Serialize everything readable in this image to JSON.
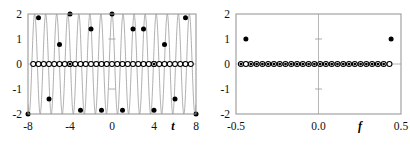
{
  "figure": {
    "title": "",
    "panels": [
      {
        "id": "time-domain",
        "xlabel": "t",
        "ylabel": "",
        "xlim": [
          -8,
          8
        ],
        "ylim": [
          -2,
          2
        ],
        "xticks": [
          -8,
          -4,
          0,
          4,
          8
        ],
        "xticklabels": [
          "-8",
          "-4",
          "0",
          "4",
          "8"
        ],
        "yticks": [
          -2,
          -1,
          0,
          1,
          2
        ],
        "yticklabels": [
          "-2",
          "-1",
          "0",
          "1",
          "2"
        ],
        "grid": false,
        "frame": true
      },
      {
        "id": "frequency-domain",
        "xlabel": "f",
        "ylabel": "",
        "xlim": [
          -0.5,
          0.5
        ],
        "ylim": [
          -2,
          2
        ],
        "xticks": [
          -0.5,
          0.0,
          0.5
        ],
        "xticklabels": [
          "-0.5",
          "0.0",
          "0.5"
        ],
        "yticks": [
          -2,
          -1,
          0,
          1,
          2
        ],
        "yticklabels": [
          "-2",
          "-1",
          "0",
          "1",
          "2"
        ],
        "grid": false,
        "frame": true
      }
    ]
  },
  "chart_data": [
    {
      "type": "line",
      "id": "time-domain",
      "title": "",
      "xlabel": "t",
      "ylabel": "",
      "xlim": [
        -8,
        8
      ],
      "ylim": [
        -2,
        2
      ],
      "xticks": [
        -8,
        -4,
        0,
        4,
        8
      ],
      "yticks": [
        -2,
        -1,
        0,
        1,
        2
      ],
      "grid": false,
      "legend": "none",
      "series": [
        {
          "name": "continuous-high-frequency-cosine",
          "type": "line",
          "color": "#9a9a9a",
          "linewidth": 0.8,
          "description": "2*cos(2*pi*0.95*t) dense aliased carrier drawn across full window",
          "amplitude": 2,
          "frequency": 0.95,
          "x": [
            -8,
            8
          ],
          "samples": 1600
        },
        {
          "name": "slow-sampled-cosine-filled-dots",
          "type": "scatter",
          "marker": "filled-circle",
          "color": "#000000",
          "size": 5,
          "x": [
            -8,
            -7,
            -6,
            -5,
            -4,
            -3,
            -2,
            -1,
            0,
            1,
            2,
            3,
            4,
            5,
            6,
            7,
            8
          ],
          "y": [
            -2.0,
            1.85,
            -1.4,
            0.78,
            2.0,
            -1.85,
            1.4,
            -1.85,
            2.0,
            -1.85,
            1.4,
            1.4,
            -1.85,
            0.78,
            -1.4,
            1.85,
            -2.0
          ]
        },
        {
          "name": "zero-level-open-circles",
          "type": "scatter",
          "marker": "open-circle",
          "color": "#000000",
          "size": 5,
          "x": [
            -7.5,
            -7.0,
            -6.5,
            -6.0,
            -5.5,
            -5.0,
            -4.5,
            -4.0,
            -3.5,
            -3.0,
            -2.5,
            -2.0,
            -1.5,
            -1.0,
            -0.5,
            0.0,
            0.5,
            1.0,
            1.5,
            2.0,
            2.5,
            3.0,
            3.5,
            4.0,
            4.5,
            5.0,
            5.5,
            6.0,
            6.5,
            7.0,
            7.5
          ],
          "y": [
            0,
            0,
            0,
            0,
            0,
            0,
            0,
            0,
            0,
            0,
            0,
            0,
            0,
            0,
            0,
            0,
            0,
            0,
            0,
            0,
            0,
            0,
            0,
            0,
            0,
            0,
            0,
            0,
            0,
            0,
            0
          ]
        },
        {
          "name": "zero-level-filled-markers",
          "type": "scatter",
          "marker": "filled-in-circle",
          "color": "#000000",
          "size": 5,
          "x": [
            -4.0,
            4.0
          ],
          "y": [
            0,
            0
          ]
        }
      ]
    },
    {
      "type": "scatter",
      "id": "frequency-domain",
      "title": "",
      "xlabel": "f",
      "ylabel": "",
      "xlim": [
        -0.5,
        0.5
      ],
      "ylim": [
        -2,
        2
      ],
      "xticks": [
        -0.5,
        0.0,
        0.5
      ],
      "yticks": [
        -2,
        -1,
        0,
        1,
        2
      ],
      "grid": false,
      "legend": "none",
      "series": [
        {
          "name": "spectral-lines-filled",
          "type": "scatter",
          "marker": "filled-circle",
          "color": "#000000",
          "size": 5,
          "x": [
            -0.44,
            0.44
          ],
          "y": [
            1.0,
            1.0
          ]
        },
        {
          "name": "zero-level-filled-in-circles",
          "type": "scatter",
          "marker": "filled-in-circle",
          "color": "#000000",
          "size": 5,
          "x": [
            -0.47,
            -0.41,
            -0.375,
            -0.34,
            -0.305,
            -0.27,
            -0.235,
            -0.2,
            -0.165,
            -0.13,
            -0.095,
            -0.06,
            -0.025,
            0.01,
            0.045,
            0.08,
            0.115,
            0.15,
            0.185,
            0.22,
            0.255,
            0.29,
            0.325,
            0.36,
            0.395
          ],
          "y": [
            0,
            0,
            0,
            0,
            0,
            0,
            0,
            0,
            0,
            0,
            0,
            0,
            0,
            0,
            0,
            0,
            0,
            0,
            0,
            0,
            0,
            0,
            0,
            0,
            0
          ]
        },
        {
          "name": "zero-level-open-circles",
          "type": "scatter",
          "marker": "open-circle",
          "color": "#000000",
          "size": 5,
          "x": [
            -0.44,
            0.43
          ],
          "y": [
            0,
            0
          ]
        }
      ]
    }
  ],
  "style": {
    "frame_color": "#8f8f8f",
    "carrier_color": "#9a9a9a",
    "marker_color": "#000000",
    "background": "#ffffff",
    "tick_color": "#9a9a9a"
  }
}
